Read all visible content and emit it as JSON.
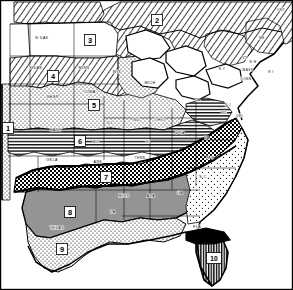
{
  "map": {
    "title": "Eastern and Central United States Zone Map",
    "description": "Black and white line map of the central and eastern United States showing ten numbered zones distinguished by hatching, stippling, checkerboard and solid fill patterns.",
    "width": 293,
    "height": 290,
    "background_color": "#ffffff",
    "ink_color": "#000000"
  },
  "zones": [
    {
      "id": "zone-1",
      "label": "1",
      "x": 8,
      "y": 128,
      "pattern": "stipple-fine",
      "wide": false
    },
    {
      "id": "zone-2",
      "label": "2",
      "x": 157,
      "y": 20,
      "pattern": "diagonal-hatch",
      "wide": false
    },
    {
      "id": "zone-3",
      "label": "3",
      "x": 90,
      "y": 40,
      "pattern": "open-white",
      "wide": false
    },
    {
      "id": "zone-4",
      "label": "4",
      "x": 53,
      "y": 76,
      "pattern": "diagonal-hatch",
      "wide": false
    },
    {
      "id": "zone-5",
      "label": "5",
      "x": 94,
      "y": 105,
      "pattern": "stipple-fine",
      "wide": false
    },
    {
      "id": "zone-6",
      "label": "6",
      "x": 80,
      "y": 141,
      "pattern": "horizontal-line",
      "wide": false
    },
    {
      "id": "zone-7",
      "label": "7",
      "x": 106,
      "y": 177,
      "pattern": "checkerboard",
      "wide": false
    },
    {
      "id": "zone-8",
      "label": "8",
      "x": 70,
      "y": 212,
      "pattern": "gray-solid",
      "wide": false
    },
    {
      "id": "zone-9",
      "label": "9",
      "x": 62,
      "y": 249,
      "pattern": "stipple-fine",
      "wide": false
    },
    {
      "id": "zone-10",
      "label": "10",
      "x": 214,
      "y": 258,
      "pattern": "dense-vertical",
      "wide": true
    }
  ],
  "states": [
    {
      "id": "state-n-dak",
      "abbr": "N DAK",
      "x": 42,
      "y": 38,
      "small": false
    },
    {
      "id": "state-s-dak",
      "abbr": "S DAK",
      "x": 36,
      "y": 68,
      "small": false
    },
    {
      "id": "state-minn",
      "abbr": "MINN",
      "x": 84,
      "y": 68,
      "small": false
    },
    {
      "id": "state-wis",
      "abbr": "WIS",
      "x": 117,
      "y": 72,
      "small": false
    },
    {
      "id": "state-nebr",
      "abbr": "NEBR",
      "x": 53,
      "y": 97,
      "small": false
    },
    {
      "id": "state-iowa",
      "abbr": "IOWA",
      "x": 90,
      "y": 92,
      "small": false
    },
    {
      "id": "state-mich",
      "abbr": "MICH",
      "x": 150,
      "y": 83,
      "small": false
    },
    {
      "id": "state-ill",
      "abbr": "ILL",
      "x": 110,
      "y": 123,
      "small": false
    },
    {
      "id": "state-ind",
      "abbr": "IND",
      "x": 136,
      "y": 120,
      "small": false
    },
    {
      "id": "state-ohio",
      "abbr": "OHIO",
      "x": 160,
      "y": 120,
      "small": false
    },
    {
      "id": "state-kans",
      "abbr": "KANS",
      "x": 56,
      "y": 130,
      "small": false
    },
    {
      "id": "state-mo",
      "abbr": "MO",
      "x": 96,
      "y": 142,
      "small": false
    },
    {
      "id": "state-ky",
      "abbr": "KY",
      "x": 148,
      "y": 142,
      "small": true
    },
    {
      "id": "state-w-va",
      "abbr": "W VA",
      "x": 180,
      "y": 133,
      "small": true
    },
    {
      "id": "state-va",
      "abbr": "VA",
      "x": 207,
      "y": 138,
      "small": false
    },
    {
      "id": "state-pa",
      "abbr": "PA",
      "x": 198,
      "y": 100,
      "small": false
    },
    {
      "id": "state-n-y",
      "abbr": "N Y",
      "x": 222,
      "y": 69,
      "small": true
    },
    {
      "id": "state-n-j",
      "abbr": "N J",
      "x": 228,
      "y": 105,
      "small": true
    },
    {
      "id": "state-md",
      "abbr": "MD",
      "x": 224,
      "y": 113,
      "small": true
    },
    {
      "id": "state-del",
      "abbr": "DEL",
      "x": 240,
      "y": 116,
      "small": true
    },
    {
      "id": "state-vt",
      "abbr": "VT",
      "x": 245,
      "y": 58,
      "small": true
    },
    {
      "id": "state-n-h",
      "abbr": "N H",
      "x": 253,
      "y": 62,
      "small": true
    },
    {
      "id": "state-me",
      "abbr": "ME",
      "x": 262,
      "y": 38,
      "small": true
    },
    {
      "id": "state-mass",
      "abbr": "MASS",
      "x": 248,
      "y": 70,
      "small": true
    },
    {
      "id": "state-r-i",
      "abbr": "R I",
      "x": 271,
      "y": 72,
      "small": true
    },
    {
      "id": "state-conn",
      "abbr": "CONN",
      "x": 246,
      "y": 79,
      "small": true
    },
    {
      "id": "state-okla",
      "abbr": "OKLA",
      "x": 52,
      "y": 160,
      "small": false
    },
    {
      "id": "state-ark",
      "abbr": "ARK",
      "x": 98,
      "y": 162,
      "small": false
    },
    {
      "id": "state-tenn",
      "abbr": "TENN",
      "x": 140,
      "y": 158,
      "small": true
    },
    {
      "id": "state-n-c",
      "abbr": "N C",
      "x": 210,
      "y": 158,
      "small": false
    },
    {
      "id": "state-s-c",
      "abbr": "S C",
      "x": 203,
      "y": 177,
      "small": false
    },
    {
      "id": "state-miss",
      "abbr": "MISS",
      "x": 124,
      "y": 196,
      "small": false
    },
    {
      "id": "state-ala",
      "abbr": "ALA",
      "x": 151,
      "y": 196,
      "small": false
    },
    {
      "id": "state-ga",
      "abbr": "GA",
      "x": 180,
      "y": 193,
      "small": false
    },
    {
      "id": "state-la",
      "abbr": "LA",
      "x": 113,
      "y": 212,
      "small": false
    },
    {
      "id": "state-texas",
      "abbr": "TEXAS",
      "x": 57,
      "y": 228,
      "small": false
    },
    {
      "id": "state-fla",
      "abbr": "FLA",
      "x": 197,
      "y": 227,
      "small": false
    },
    {
      "id": "state-ont",
      "abbr": "ONT",
      "x": 281,
      "y": 10,
      "small": true
    }
  ],
  "legend_note": ""
}
